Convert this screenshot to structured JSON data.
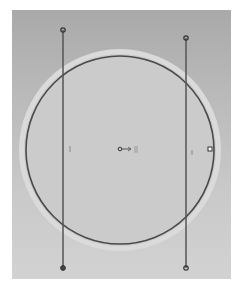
{
  "canvas": {
    "frame": {
      "x": 12,
      "y": 10,
      "width": 219,
      "height": 269
    },
    "colors": {
      "frame_top": "#a9a9a9",
      "frame_bottom": "#d2d2d2",
      "disc_fill": "#cbcbcb",
      "halo": "#dcdcdc",
      "outline": "#4a4a4a",
      "guide_line": "#555555"
    }
  },
  "circle": {
    "center": {
      "x": 120,
      "y": 150
    },
    "radius": 94,
    "halo_radius": 101
  },
  "guides": [
    {
      "name": "left-guide",
      "x": 63,
      "y1": 30,
      "y2": 268
    },
    {
      "name": "right-guide",
      "x": 186,
      "y1": 38,
      "y2": 268
    }
  ],
  "handles": [
    {
      "name": "left-guide-top-handle",
      "x": 63,
      "y": 30
    },
    {
      "name": "left-guide-bottom-handle",
      "x": 63,
      "y": 268
    },
    {
      "name": "right-guide-top-handle",
      "x": 186,
      "y": 38
    },
    {
      "name": "right-guide-bottom-handle",
      "x": 186,
      "y": 268
    },
    {
      "name": "circle-edge-handle",
      "x": 210,
      "y": 149
    }
  ],
  "center_marker": {
    "x": 120,
    "y": 149,
    "glyph": "anchor-arrow"
  }
}
